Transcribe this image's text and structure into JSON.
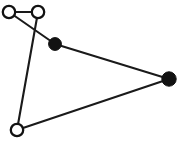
{
  "figure": {
    "kind": "node-link-diagram",
    "title": "",
    "width": 185,
    "height": 150,
    "background_color": "#ffffff",
    "stroke_color": "#1a1a1a",
    "fill_color": "#121212",
    "hollow_fill_color": "#ffffff"
  },
  "chart_data": {
    "type": "scatter",
    "title": "",
    "xlabel": "",
    "ylabel": "",
    "xlim": [
      0,
      185
    ],
    "ylim": [
      0,
      150
    ],
    "grid": false,
    "legend": "none",
    "nodes": [
      {
        "id": "A",
        "x": 9,
        "y": 12,
        "style": "hollow",
        "radius": 6.2,
        "label": ""
      },
      {
        "id": "B",
        "x": 38,
        "y": 12,
        "style": "hollow",
        "radius": 6.2,
        "label": ""
      },
      {
        "id": "C",
        "x": 55,
        "y": 44,
        "style": "filled",
        "radius": 6.4,
        "label": ""
      },
      {
        "id": "D",
        "x": 169,
        "y": 79,
        "style": "filled",
        "radius": 7.2,
        "label": ""
      },
      {
        "id": "E",
        "x": 17,
        "y": 130,
        "style": "hollow",
        "radius": 6.2,
        "label": ""
      }
    ],
    "edges": [
      {
        "from": "A",
        "to": "B",
        "label": ""
      },
      {
        "from": "A",
        "to": "C",
        "label": ""
      },
      {
        "from": "B",
        "to": "E",
        "label": ""
      },
      {
        "from": "C",
        "to": "D",
        "label": ""
      },
      {
        "from": "E",
        "to": "D",
        "label": ""
      }
    ],
    "counts": {
      "nodes": 5,
      "hollow_nodes": 3,
      "filled_nodes": 2,
      "edges": 5
    }
  }
}
